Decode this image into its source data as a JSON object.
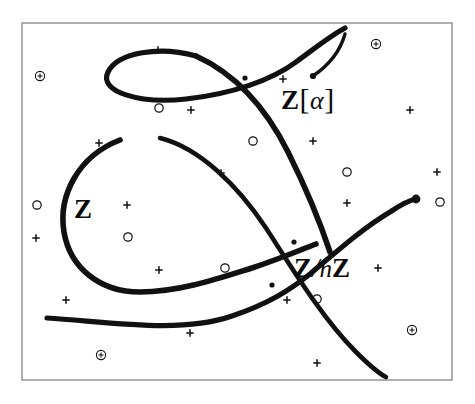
{
  "figure": {
    "background_color": "#ffffff",
    "ink_color": "#111111",
    "frame": {
      "x": 22,
      "y": 23,
      "width": 430,
      "height": 357,
      "stroke_color": "#8d8d8d",
      "stroke_width": 1.4
    }
  },
  "labels": {
    "base_curve": "Z",
    "extension_curve_z": "Z",
    "extension_curve_open_bracket": "[",
    "extension_curve_alpha": "α",
    "extension_curve_close_bracket": "]",
    "quotient_curve_z1": "Z",
    "quotient_curve_slash": "/",
    "quotient_curve_n": "n",
    "quotient_curve_z2": "Z",
    "extension_curve_full": "Z[α]",
    "quotient_curve_full": "Z/nZ"
  },
  "chart_data": {
    "type": "line",
    "xlabel": "",
    "ylabel": "",
    "xlim": [
      22,
      452
    ],
    "ylim": [
      23,
      380
    ],
    "grid": false,
    "legend": "inline-annotations",
    "series": [
      {
        "name": "Z",
        "label": "Z",
        "label_position": [
          74,
          196
        ],
        "stroke_width": 5.2,
        "path": "M 196 56 C 160 46 118 52 108 72 C 98 92 140 104 186 99 C 232 94 272 80 296 62 C 318 46 330 36 345 28",
        "description": "upper lens-shaped loop crossing itself near (245,78) and running off toward upper right"
      },
      {
        "name": "Z-main-loop",
        "label": "Z",
        "stroke_width": 5.6,
        "path": "M 196 56 C 240 76 268 112 288 152 C 310 196 322 228 330 252",
        "description": "descending right flank of the upper loop into the crossing region"
      },
      {
        "name": "Z-teardrop",
        "label": "Z",
        "stroke_width": 5.6,
        "path": "M 120 140 C 78 156 58 196 64 232 C 70 268 100 292 140 292 C 180 292 220 278 252 268 C 282 258 300 250 316 244",
        "description": "large left teardrop loop enclosing the Z label"
      },
      {
        "name": "Z[alpha]",
        "label": "Z[α]",
        "label_position": [
          281,
          84
        ],
        "stroke_width": 5.2,
        "path": "M 47 318 C 110 322 180 334 232 316 C 268 304 290 290 310 274 C 334 254 360 230 390 212 C 402 204 410 200 416 199",
        "description": "sweeping curve from lower-left thin tail up to the right terminal blob"
      },
      {
        "name": "Z/nZ",
        "label": "Z/nZ",
        "label_position": [
          294,
          255
        ],
        "stroke_width": 4.6,
        "path": "M 160 138 C 200 148 238 186 266 228 C 292 268 322 318 356 352 C 370 366 380 374 386 377",
        "description": "long diagonal fibre descending to the lower right border"
      }
    ],
    "nodes": [
      {
        "name": "crossing-upper-loop",
        "x": 245,
        "y": 78
      },
      {
        "name": "crossing-upper",
        "x": 294,
        "y": 242
      },
      {
        "name": "crossing-lower",
        "x": 272,
        "y": 285
      },
      {
        "name": "terminal-right",
        "x": 416,
        "y": 199
      },
      {
        "name": "pointer-dot",
        "x": 313,
        "y": 76
      }
    ],
    "pointer": {
      "name": "leader-arrow",
      "from": [
        313,
        76
      ],
      "to": [
        345,
        34
      ],
      "description": "hand-drawn leader stroke from the Z[alpha] label toward the upper-right curve end"
    },
    "markers": {
      "circled_dot": [
        {
          "x": 40,
          "y": 76,
          "r": 4.6
        },
        {
          "x": 376,
          "y": 44,
          "r": 4.6
        },
        {
          "x": 101,
          "y": 355,
          "r": 4.6
        },
        {
          "x": 412,
          "y": 330,
          "r": 4.6
        }
      ],
      "open_circle": [
        {
          "x": 159,
          "y": 108,
          "r": 4.2
        },
        {
          "x": 253,
          "y": 141,
          "r": 4.2
        },
        {
          "x": 347,
          "y": 172,
          "r": 4.2
        },
        {
          "x": 37,
          "y": 205,
          "r": 4.2
        },
        {
          "x": 440,
          "y": 202,
          "r": 4.2
        },
        {
          "x": 128,
          "y": 237,
          "r": 4.2
        },
        {
          "x": 225,
          "y": 268,
          "r": 4.2
        },
        {
          "x": 317,
          "y": 299,
          "r": 4.2
        }
      ],
      "small_plus": [
        {
          "x": 158,
          "y": 50,
          "s": 3.2
        },
        {
          "x": 283,
          "y": 79,
          "s": 3.2
        },
        {
          "x": 410,
          "y": 110,
          "s": 3.2
        },
        {
          "x": 191,
          "y": 110,
          "s": 3.2
        },
        {
          "x": 99,
          "y": 143,
          "s": 3.2
        },
        {
          "x": 313,
          "y": 141,
          "s": 3.2
        },
        {
          "x": 437,
          "y": 172,
          "s": 3.2
        },
        {
          "x": 221,
          "y": 173,
          "s": 3.2
        },
        {
          "x": 127,
          "y": 205,
          "s": 3.2
        },
        {
          "x": 347,
          "y": 203,
          "s": 3.2
        },
        {
          "x": 36,
          "y": 238,
          "s": 3.2
        },
        {
          "x": 159,
          "y": 270,
          "s": 3.2
        },
        {
          "x": 378,
          "y": 268,
          "s": 3.2
        },
        {
          "x": 66,
          "y": 300,
          "s": 3.2
        },
        {
          "x": 287,
          "y": 300,
          "s": 3.2
        },
        {
          "x": 190,
          "y": 333,
          "s": 3.2
        },
        {
          "x": 317,
          "y": 363,
          "s": 3.2
        }
      ]
    }
  }
}
